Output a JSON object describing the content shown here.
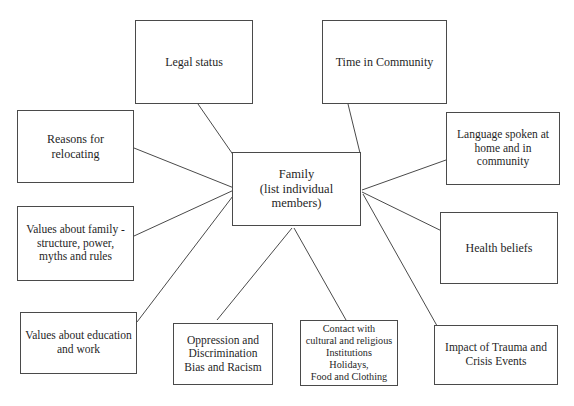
{
  "diagram": {
    "background_color": "#ffffff",
    "line_color": "#4a4a4a",
    "center": {
      "label": "Family\n(list individual members)"
    },
    "nodes": [
      {
        "id": "legal-status",
        "label": "Legal status"
      },
      {
        "id": "time-in-community",
        "label": "Time in Community"
      },
      {
        "id": "reasons-relocating",
        "label": "Reasons for\nrelocating"
      },
      {
        "id": "language-spoken",
        "label": "Language spoken at\nhome and in\ncommunity"
      },
      {
        "id": "values-family",
        "label": "Values about family -\nstructure, power,\nmyths and rules"
      },
      {
        "id": "health-beliefs",
        "label": "Health beliefs"
      },
      {
        "id": "values-education",
        "label": "Values about education\nand work"
      },
      {
        "id": "oppression",
        "label": "Oppression and\nDiscrimination\nBias and Racism"
      },
      {
        "id": "contact-cultural",
        "label": "Contact with\ncultural and religious\nInstitutions\nHolidays,\nFood and Clothing"
      },
      {
        "id": "trauma-impact",
        "label": "Impact of  Trauma and\nCrisis Events"
      }
    ]
  }
}
